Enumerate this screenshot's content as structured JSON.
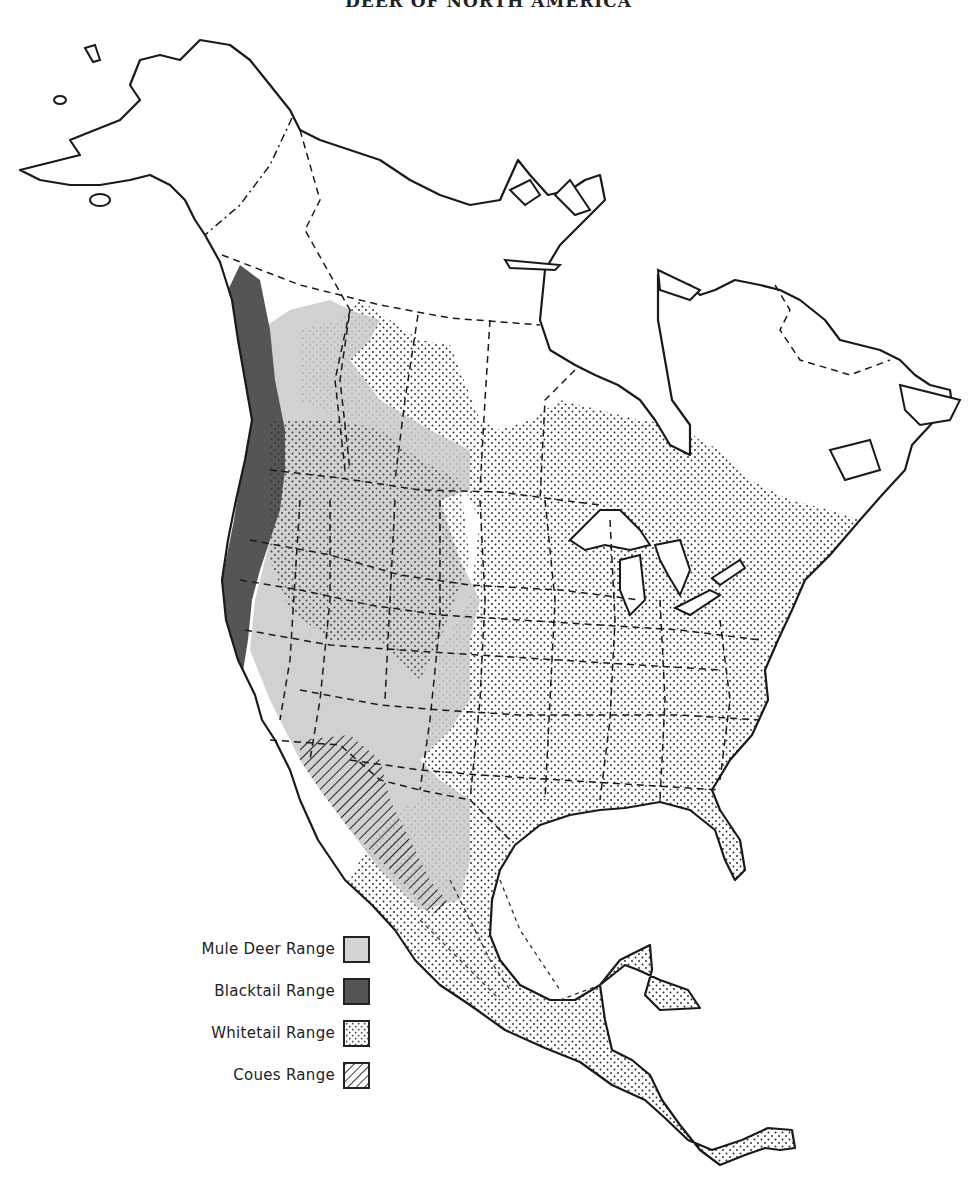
{
  "title": "DEER OF NORTH AMERICA",
  "colors": {
    "outline": "#1a1a1a",
    "mule": "#c9c9c9",
    "blacktail": "#555555",
    "whitetail_dot": "#333333",
    "coues_hatch": "#222222",
    "background": "#ffffff"
  },
  "legend": {
    "items": [
      {
        "label": "Mule Deer Range",
        "pattern": "mule"
      },
      {
        "label": "Blacktail Range",
        "pattern": "blacktail"
      },
      {
        "label": "Whitetail Range",
        "pattern": "whitetail"
      },
      {
        "label": "Coues Range",
        "pattern": "coues"
      }
    ]
  }
}
